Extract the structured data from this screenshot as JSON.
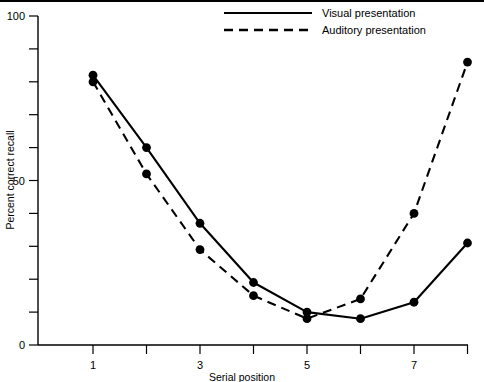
{
  "chart_data": {
    "type": "line",
    "title": "",
    "xlabel": "Serial position",
    "ylabel": "Percent correct recall",
    "x": [
      1,
      2,
      3,
      4,
      5,
      6,
      7,
      8
    ],
    "xlim": [
      0.6,
      8.4
    ],
    "ylim": [
      0,
      100
    ],
    "xticks": [
      1,
      2,
      3,
      4,
      5,
      6,
      7,
      8
    ],
    "xtick_labels": [
      "1",
      "",
      "3",
      "",
      "5",
      "",
      "7",
      ""
    ],
    "yticks": [
      0,
      10,
      20,
      30,
      40,
      50,
      60,
      70,
      80,
      90,
      100
    ],
    "ytick_labels": [
      "0",
      "",
      "",
      "",
      "",
      "50",
      "",
      "",
      "",
      "",
      "100"
    ],
    "grid": false,
    "legend_position": "top-right",
    "series": [
      {
        "name": "Visual presentation",
        "style": "solid",
        "marker": "filled-circle",
        "values": [
          82,
          60,
          37,
          19,
          10,
          8,
          13,
          31
        ]
      },
      {
        "name": "Auditory presentation",
        "style": "dashed",
        "marker": "filled-circle",
        "values": [
          80,
          52,
          29,
          15,
          8,
          14,
          40,
          86
        ]
      }
    ]
  },
  "legend": {
    "entries": [
      {
        "label": "Visual presentation",
        "style": "solid"
      },
      {
        "label": "Auditory presentation",
        "style": "dashed"
      }
    ]
  },
  "axes": {
    "y_title": "Percent correct recall",
    "x_title": "Serial position",
    "y_labels": {
      "zero": "0",
      "mid": "50",
      "top": "100"
    },
    "x_labels": {
      "p1": "1",
      "p3": "3",
      "p5": "5",
      "p7": "7"
    }
  },
  "colors": {
    "ink": "#000000",
    "background": "#ffffff"
  }
}
